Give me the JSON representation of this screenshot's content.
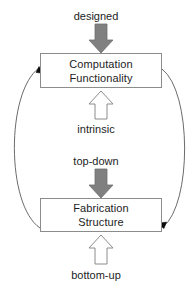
{
  "diagram": {
    "type": "cycle-diagram",
    "canvas": {
      "width": 192,
      "height": 292,
      "background": "#ffffff"
    },
    "colors": {
      "solid_arrow_fill": "#808080",
      "solid_arrow_stroke": "#6e6e6e",
      "hollow_arrow_fill": "#ffffff",
      "hollow_arrow_stroke": "#8c8c8c",
      "box_border": "#8c8c8c",
      "box_fill": "#ffffff",
      "curve_stroke": "#5a5a5a",
      "arrowhead_fill": "#000000",
      "text": "#1d1d1d"
    },
    "nodes": [
      {
        "id": "computation",
        "lines": [
          "Computation",
          "Functionality"
        ],
        "line1": "Computation",
        "line2": "Functionality"
      },
      {
        "id": "fabrication",
        "lines": [
          "Fabrication",
          "Structure"
        ],
        "line1": "Fabrication",
        "line2": "Structure"
      }
    ],
    "edge_labels": {
      "designed": "designed",
      "intrinsic": "intrinsic",
      "top_down": "top-down",
      "bottom_up": "bottom-up"
    },
    "arrows": [
      {
        "id": "designed-arrow",
        "style": "solid-gray",
        "direction": "down",
        "label": "designed",
        "target": "computation"
      },
      {
        "id": "intrinsic-arrow",
        "style": "hollow-outline",
        "direction": "up",
        "label": "intrinsic",
        "target": "computation"
      },
      {
        "id": "top-down-arrow",
        "style": "solid-gray",
        "direction": "down",
        "label": "top-down",
        "target": "fabrication"
      },
      {
        "id": "bottom-up-arrow",
        "style": "hollow-outline",
        "direction": "up",
        "label": "bottom-up",
        "target": "fabrication"
      },
      {
        "id": "left-curve-arrow",
        "style": "thin-curve",
        "direction": "up",
        "label": "",
        "from": "fabrication",
        "to": "computation"
      },
      {
        "id": "right-curve-arrow",
        "style": "thin-curve",
        "direction": "down",
        "label": "",
        "from": "computation",
        "to": "fabrication"
      }
    ]
  }
}
